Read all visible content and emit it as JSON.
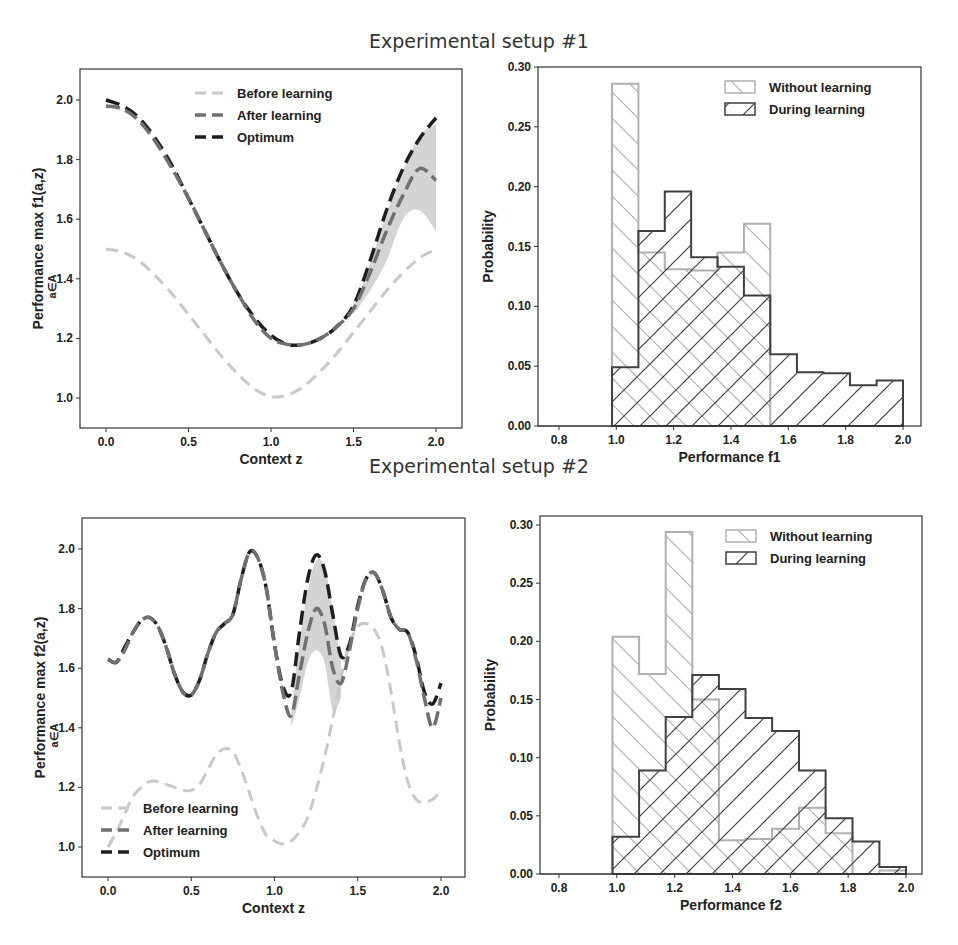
{
  "titles": {
    "setup1": "Experimental setup #1",
    "setup2": "Experimental setup #2"
  },
  "colors": {
    "before": "#c8c8c8",
    "after": "#707070",
    "optimum": "#1e1e1e",
    "band": "#d4d4d4",
    "without": "#b0b0b0",
    "during": "#404040"
  },
  "chart_data": [
    {
      "id": "setup1-line",
      "type": "line",
      "title": "Experimental setup #1",
      "xlabel": "Context  z",
      "ylabel": "Performance max f1(a,z)",
      "ylabel_sub": "a∈A",
      "xlim": [
        -0.15,
        2.15
      ],
      "ylim": [
        0.9,
        2.1
      ],
      "xticks": [
        "0.0",
        "0.5",
        "1.0",
        "1.5",
        "2.0"
      ],
      "yticks": [
        "1.0",
        "1.2",
        "1.4",
        "1.6",
        "1.8",
        "2.0"
      ],
      "legend": [
        "Before learning",
        "After learning",
        "Optimum"
      ],
      "legend_position": "upper center",
      "x": [
        0.0,
        0.1,
        0.2,
        0.3,
        0.4,
        0.5,
        0.6,
        0.7,
        0.8,
        0.9,
        1.0,
        1.1,
        1.2,
        1.3,
        1.4,
        1.5,
        1.6,
        1.7,
        1.8,
        1.9,
        2.0
      ],
      "series": [
        {
          "name": "Before learning",
          "values": [
            1.5,
            1.49,
            1.46,
            1.41,
            1.35,
            1.28,
            1.21,
            1.14,
            1.08,
            1.03,
            1.005,
            1.01,
            1.04,
            1.09,
            1.15,
            1.22,
            1.29,
            1.36,
            1.42,
            1.47,
            1.5
          ]
        },
        {
          "name": "After learning",
          "values": [
            1.98,
            1.97,
            1.93,
            1.86,
            1.77,
            1.67,
            1.56,
            1.45,
            1.35,
            1.26,
            1.2,
            1.18,
            1.18,
            1.2,
            1.24,
            1.3,
            1.42,
            1.56,
            1.68,
            1.77,
            1.73
          ]
        },
        {
          "name": "Optimum",
          "values": [
            2.0,
            1.98,
            1.94,
            1.87,
            1.78,
            1.67,
            1.56,
            1.45,
            1.35,
            1.27,
            1.21,
            1.18,
            1.18,
            1.2,
            1.24,
            1.31,
            1.46,
            1.63,
            1.77,
            1.87,
            1.94
          ]
        }
      ],
      "band": {
        "name": "After learning spread",
        "x": [
          1.5,
          1.6,
          1.7,
          1.8,
          1.9,
          2.0
        ],
        "low": [
          1.28,
          1.36,
          1.46,
          1.6,
          1.63,
          1.56
        ],
        "high": [
          1.3,
          1.45,
          1.62,
          1.76,
          1.88,
          1.92
        ]
      }
    },
    {
      "id": "setup1-hist",
      "type": "bar",
      "subtype": "histogram-step",
      "xlabel": "Performance  f1",
      "ylabel": "Probability",
      "xlim": [
        0.74,
        2.1
      ],
      "ylim": [
        0.0,
        0.3
      ],
      "xticks": [
        "0.8",
        "1.0",
        "1.2",
        "1.4",
        "1.6",
        "1.8",
        "2.0"
      ],
      "yticks": [
        "0.00",
        "0.05",
        "0.10",
        "0.15",
        "0.20",
        "0.25",
        "0.30"
      ],
      "legend": [
        "Without learning",
        "During learning"
      ],
      "legend_position": "upper right",
      "bin_edges": [
        0.985,
        1.077,
        1.169,
        1.261,
        1.353,
        1.445,
        1.537,
        1.63,
        1.722,
        1.815,
        1.908,
        2.0
      ],
      "series": [
        {
          "name": "Without learning",
          "values": [
            0.286,
            0.145,
            0.131,
            0.13,
            0.145,
            0.169,
            0,
            0,
            0,
            0,
            0
          ]
        },
        {
          "name": "During learning",
          "values": [
            0.049,
            0.163,
            0.196,
            0.141,
            0.133,
            0.109,
            0.06,
            0.045,
            0.044,
            0.034,
            0.038
          ]
        }
      ]
    },
    {
      "id": "setup2-line",
      "type": "line",
      "title": "Experimental setup #2",
      "xlabel": "Context  z",
      "ylabel": "Performance max f2(a,z)",
      "ylabel_sub": "a∈A",
      "xlim": [
        -0.15,
        2.15
      ],
      "ylim": [
        0.9,
        2.1
      ],
      "xticks": [
        "0.0",
        "0.5",
        "1.0",
        "1.5",
        "2.0"
      ],
      "yticks": [
        "1.0",
        "1.2",
        "1.4",
        "1.6",
        "1.8",
        "2.0"
      ],
      "legend": [
        "Before learning",
        "After learning",
        "Optimum"
      ],
      "legend_position": "lower left",
      "x": [
        0.0,
        0.05,
        0.1,
        0.15,
        0.2,
        0.25,
        0.3,
        0.35,
        0.4,
        0.45,
        0.5,
        0.55,
        0.6,
        0.65,
        0.7,
        0.75,
        0.8,
        0.85,
        0.9,
        0.95,
        1.0,
        1.05,
        1.1,
        1.15,
        1.2,
        1.25,
        1.3,
        1.35,
        1.4,
        1.45,
        1.5,
        1.55,
        1.6,
        1.65,
        1.7,
        1.75,
        1.8,
        1.85,
        1.9,
        1.95,
        2.0
      ],
      "series": [
        {
          "name": "Before learning",
          "values": [
            1.0,
            1.05,
            1.11,
            1.17,
            1.2,
            1.22,
            1.22,
            1.21,
            1.2,
            1.19,
            1.19,
            1.21,
            1.26,
            1.31,
            1.33,
            1.32,
            1.26,
            1.18,
            1.1,
            1.04,
            1.02,
            1.01,
            1.02,
            1.05,
            1.1,
            1.19,
            1.3,
            1.43,
            1.57,
            1.68,
            1.74,
            1.75,
            1.73,
            1.66,
            1.52,
            1.35,
            1.22,
            1.16,
            1.15,
            1.16,
            1.19
          ]
        },
        {
          "name": "After learning",
          "values": [
            1.63,
            1.62,
            1.66,
            1.72,
            1.76,
            1.77,
            1.74,
            1.67,
            1.58,
            1.52,
            1.51,
            1.56,
            1.65,
            1.72,
            1.75,
            1.78,
            1.9,
            1.99,
            1.97,
            1.87,
            1.68,
            1.52,
            1.44,
            1.58,
            1.72,
            1.8,
            1.75,
            1.6,
            1.55,
            1.66,
            1.8,
            1.9,
            1.92,
            1.86,
            1.77,
            1.73,
            1.72,
            1.63,
            1.5,
            1.4,
            1.5
          ]
        },
        {
          "name": "Optimum",
          "values": [
            1.63,
            1.62,
            1.67,
            1.72,
            1.76,
            1.77,
            1.74,
            1.67,
            1.58,
            1.52,
            1.51,
            1.56,
            1.65,
            1.72,
            1.75,
            1.78,
            1.9,
            1.99,
            1.97,
            1.87,
            1.68,
            1.54,
            1.52,
            1.72,
            1.9,
            1.98,
            1.93,
            1.78,
            1.64,
            1.68,
            1.81,
            1.9,
            1.92,
            1.86,
            1.77,
            1.73,
            1.72,
            1.64,
            1.52,
            1.48,
            1.55
          ]
        }
      ],
      "band": {
        "name": "After learning spread",
        "x": [
          1.1,
          1.15,
          1.2,
          1.25,
          1.3,
          1.35,
          1.4
        ],
        "low": [
          1.4,
          1.5,
          1.62,
          1.66,
          1.62,
          1.46,
          1.5
        ],
        "high": [
          1.45,
          1.68,
          1.86,
          1.96,
          1.94,
          1.8,
          1.62
        ]
      }
    },
    {
      "id": "setup2-hist",
      "type": "bar",
      "subtype": "histogram-step",
      "xlabel": "Performance  f2",
      "ylabel": "Probability",
      "xlim": [
        0.74,
        2.1
      ],
      "ylim": [
        0.0,
        0.31
      ],
      "xticks": [
        "0.8",
        "1.0",
        "1.2",
        "1.4",
        "1.6",
        "1.8",
        "2.0"
      ],
      "yticks": [
        "0.00",
        "0.05",
        "0.10",
        "0.15",
        "0.20",
        "0.25",
        "0.30"
      ],
      "legend": [
        "Without learning",
        "During learning"
      ],
      "legend_position": "upper right",
      "bin_edges": [
        0.985,
        1.077,
        1.169,
        1.261,
        1.353,
        1.445,
        1.537,
        1.63,
        1.722,
        1.815,
        1.908,
        2.0
      ],
      "series": [
        {
          "name": "Without learning",
          "values": [
            0.204,
            0.172,
            0.294,
            0.15,
            0.029,
            0.03,
            0.039,
            0.057,
            0.035,
            0.0,
            0.003
          ]
        },
        {
          "name": "During learning",
          "values": [
            0.032,
            0.089,
            0.135,
            0.171,
            0.159,
            0.134,
            0.123,
            0.089,
            0.048,
            0.028,
            0.006
          ]
        }
      ]
    }
  ]
}
